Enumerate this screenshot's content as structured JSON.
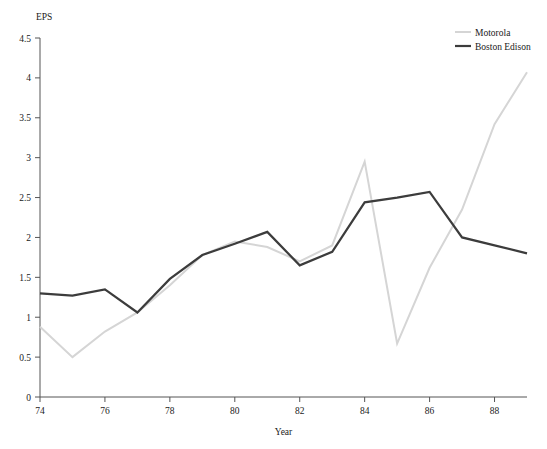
{
  "chart_data": {
    "type": "line",
    "title": "",
    "xlabel": "Year",
    "ylabel": "EPS",
    "x": [
      74,
      75,
      76,
      77,
      78,
      79,
      80,
      81,
      82,
      83,
      84,
      85,
      86,
      87,
      88,
      89
    ],
    "xlim": [
      74,
      89
    ],
    "ylim": [
      0,
      4.5
    ],
    "xticks": [
      74,
      76,
      78,
      80,
      82,
      84,
      86,
      88
    ],
    "xtick_labels": [
      "74",
      "76",
      "78",
      "80",
      "82",
      "84",
      "86",
      "88"
    ],
    "yticks": [
      0,
      0.5,
      1,
      1.5,
      2,
      2.5,
      3,
      3.5,
      4,
      4.5
    ],
    "ytick_labels": [
      "0",
      "0.5",
      "1",
      "1.5",
      "2",
      "2.5",
      "3",
      "3.5",
      "4",
      "4.5"
    ],
    "grid": false,
    "legend_position": "top-right",
    "series": [
      {
        "name": "Motorola",
        "color": "#d5d5d5",
        "width": 2.0,
        "values": [
          0.88,
          0.5,
          0.82,
          1.06,
          1.4,
          1.78,
          1.95,
          1.88,
          1.7,
          1.9,
          2.95,
          0.67,
          1.62,
          2.35,
          3.42,
          4.07
        ]
      },
      {
        "name": "Boston Edison",
        "color": "#3c3c3c",
        "width": 2.2,
        "values": [
          1.3,
          1.27,
          1.35,
          1.06,
          1.48,
          1.78,
          1.92,
          2.07,
          1.65,
          1.82,
          2.44,
          2.5,
          2.57,
          2.0,
          1.9,
          1.8
        ]
      }
    ]
  },
  "legend": {
    "entries": [
      {
        "label": "Motorola"
      },
      {
        "label": "Boston Edison"
      }
    ]
  },
  "axes": {
    "y_axis_caption": "EPS",
    "x_axis_caption": "Year"
  }
}
